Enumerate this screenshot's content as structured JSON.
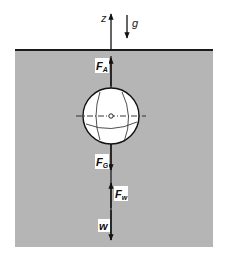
{
  "diagram": {
    "colors": {
      "background": "#ffffff",
      "fluid": "#b5b5b5",
      "surface_line": "#1a1a1a",
      "sphere_fill": "#ffffff",
      "stroke": "#111111",
      "label_bg": "#ffffff"
    },
    "axis": {
      "label": "z"
    },
    "gravity": {
      "label": "g"
    },
    "forces": [
      {
        "id": "buoyancy",
        "symbol": "F",
        "subscript": "A",
        "direction": "up"
      },
      {
        "id": "weight",
        "symbol": "F",
        "subscript": "G",
        "direction": "down"
      },
      {
        "id": "drag",
        "symbol": "F",
        "subscript": "w",
        "direction": "up"
      },
      {
        "id": "velocity",
        "symbol": "w",
        "subscript": "",
        "direction": "down"
      }
    ]
  }
}
